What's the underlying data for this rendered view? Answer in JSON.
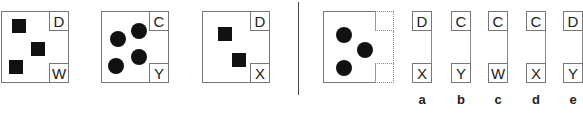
{
  "sequence": [
    {
      "top_label": "D",
      "bottom_label": "W",
      "shape": "square",
      "count": 3
    },
    {
      "top_label": "C",
      "bottom_label": "Y",
      "shape": "circle",
      "count": 4
    },
    {
      "top_label": "D",
      "bottom_label": "X",
      "shape": "square",
      "count": 2
    }
  ],
  "question": {
    "shape": "circle",
    "count": 3
  },
  "options": [
    {
      "letter": "a",
      "top_label": "D",
      "bottom_label": "X"
    },
    {
      "letter": "b",
      "top_label": "C",
      "bottom_label": "Y"
    },
    {
      "letter": "c",
      "top_label": "C",
      "bottom_label": "W"
    },
    {
      "letter": "d",
      "top_label": "C",
      "bottom_label": "X"
    },
    {
      "letter": "e",
      "top_label": "D",
      "bottom_label": "Y"
    }
  ]
}
